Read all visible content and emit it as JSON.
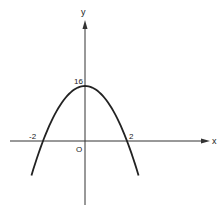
{
  "chart_data": {
    "type": "line",
    "title": "",
    "xlabel": "x",
    "ylabel": "y",
    "function": "y = 16 - 4x^2",
    "annotations": {
      "y_intercept": "16",
      "origin": "O",
      "root_left": "-2",
      "root_right": "2"
    },
    "x": [
      -2.55,
      -2.0,
      -1.5,
      -1.0,
      -0.5,
      0.0,
      0.5,
      1.0,
      1.5,
      2.0,
      2.55
    ],
    "values": [
      -10.0,
      0.0,
      7.0,
      12.0,
      15.0,
      16.0,
      15.0,
      12.0,
      7.0,
      0.0,
      -10.0
    ],
    "xlim": [
      -4,
      6.5
    ],
    "ylim": [
      -20,
      37
    ],
    "grid": false,
    "legend": null
  },
  "labels": {
    "x_axis": "x",
    "y_axis": "y",
    "vertex": "16",
    "origin": "O",
    "neg_root": "-2",
    "pos_root": "2"
  },
  "colors": {
    "curve": "#222222",
    "axis": "#333333"
  }
}
